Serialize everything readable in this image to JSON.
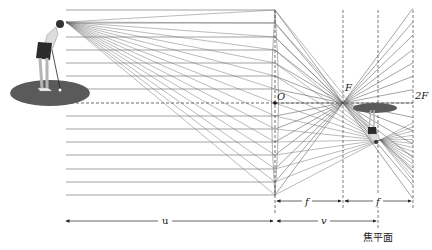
{
  "diagram": {
    "title": "",
    "labels": {
      "optical_center": "O",
      "focal_point": "F",
      "double_focal": "2F",
      "focal_length_1": "f",
      "focal_length_2": "f",
      "object_distance": "u",
      "image_distance": "v",
      "focal_plane": "焦平面"
    },
    "colors": {
      "ray": "#666666",
      "axis": "#444444",
      "ground": "#555555",
      "text": "#222222"
    },
    "geometry": {
      "lens_x": 275,
      "lens_top": 10,
      "lens_bottom": 196,
      "axis_y": 103,
      "focal_x": 343,
      "focal_plane_x": 378,
      "double_focal_x": 413,
      "parallel_ray_ys": [
        10,
        23,
        37,
        50,
        63,
        76,
        89,
        116,
        129,
        142,
        155,
        169,
        182,
        195
      ],
      "object_point": [
        66,
        22
      ],
      "image_point": [
        380,
        140
      ],
      "parallel_start_x": 66
    },
    "object": {
      "name": "golfer",
      "ground_center": [
        50,
        93
      ],
      "ground_rx": 40,
      "ground_ry": 13
    },
    "image": {
      "name": "inverted-golfer",
      "ground_center": [
        375,
        108
      ],
      "ground_rx": 22,
      "ground_ry": 5
    }
  }
}
